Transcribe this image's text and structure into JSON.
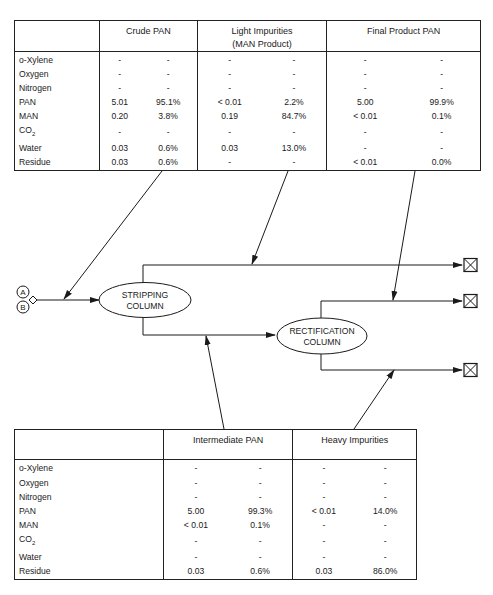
{
  "top_table": {
    "headers": [
      "",
      "Crude PAN",
      "Light Impurities\n(MAN Product)",
      "Final Product PAN"
    ],
    "header_lines": {
      "crude_pan": "Crude PAN",
      "light_impurities_1": "Light Impurities",
      "light_impurities_2": "(MAN Product)",
      "final_product_pan": "Final Product PAN"
    },
    "rows": [
      {
        "component": "o-Xylene",
        "values": [
          "-",
          "-",
          "-",
          "-",
          "-",
          "-"
        ]
      },
      {
        "component": "Oxygen",
        "values": [
          "-",
          "-",
          "-",
          "-",
          "-",
          "-"
        ]
      },
      {
        "component": "Nitrogen",
        "values": [
          "-",
          "-",
          "-",
          "-",
          "-",
          "-"
        ]
      },
      {
        "component": "PAN",
        "values": [
          "5.01",
          "95.1%",
          "< 0.01",
          "2.2%",
          "5.00",
          "99.9%"
        ]
      },
      {
        "component": "MAN",
        "values": [
          "0.20",
          "3.8%",
          "0.19",
          "84.7%",
          "< 0.01",
          "0.1%"
        ]
      },
      {
        "component": "CO2",
        "values": [
          "-",
          "-",
          "-",
          "-",
          "-",
          "-"
        ]
      },
      {
        "component": "Water",
        "values": [
          "0.03",
          "0.6%",
          "0.03",
          "13.0%",
          "-",
          "-"
        ]
      },
      {
        "component": "Residue",
        "values": [
          "0.03",
          "0.6%",
          "-",
          "-",
          "< 0.01",
          "0.0%"
        ]
      }
    ]
  },
  "bottom_table": {
    "header_lines": {
      "intermediate_pan": "Intermediate PAN",
      "heavy_impurities": "Heavy Impurities"
    },
    "rows": [
      {
        "component": "o-Xylene",
        "values": [
          "-",
          "-",
          "-",
          "-"
        ]
      },
      {
        "component": "Oxygen",
        "values": [
          "-",
          "-",
          "-",
          "-"
        ]
      },
      {
        "component": "Nitrogen",
        "values": [
          "-",
          "-",
          "-",
          "-"
        ]
      },
      {
        "component": "PAN",
        "values": [
          "5.00",
          "99.3%",
          "< 0.01",
          "14.0%"
        ]
      },
      {
        "component": "MAN",
        "values": [
          "< 0.01",
          "0.1%",
          "-",
          "-"
        ]
      },
      {
        "component": "CO2",
        "values": [
          "-",
          "-",
          "-",
          "-"
        ]
      },
      {
        "component": "Water",
        "values": [
          "-",
          "-",
          "-",
          "-"
        ]
      },
      {
        "component": "Residue",
        "values": [
          "0.03",
          "0.6%",
          "0.03",
          "86.0%"
        ]
      }
    ]
  },
  "flow": {
    "inlet_connectors": [
      "A",
      "B"
    ],
    "stripping_column": {
      "line1": "STRIPPING",
      "line2": "COLUMN"
    },
    "rectification_column": {
      "line1": "RECTIFICATION",
      "line2": "COLUMN"
    },
    "terminal_count": 3,
    "line_color": "#1a1a1a"
  }
}
